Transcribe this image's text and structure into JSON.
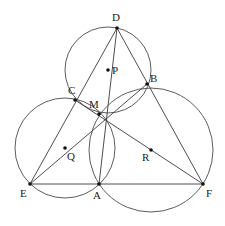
{
  "diagram": {
    "type": "geometry",
    "colors": {
      "stroke": "#4a4a4a",
      "point": "#111111",
      "label": "#222222",
      "background": "#ffffff"
    },
    "points": {
      "D": {
        "x": 117,
        "y": 28,
        "label": "D",
        "lx": 112,
        "ly": 21
      },
      "B": {
        "x": 147,
        "y": 84,
        "label": "B",
        "lx": 150,
        "ly": 82
      },
      "C": {
        "x": 75,
        "y": 100,
        "label": "C",
        "lx": 68,
        "ly": 94
      },
      "M": {
        "x": 99,
        "y": 114,
        "label": "M",
        "lx": 89,
        "ly": 108
      },
      "P": {
        "x": 108,
        "y": 70,
        "label": "P",
        "lx": 112,
        "ly": 74
      },
      "Q": {
        "x": 65,
        "y": 148,
        "label": "Q",
        "lx": 67,
        "ly": 160
      },
      "R": {
        "x": 151,
        "y": 150,
        "label": "R",
        "lx": 142,
        "ly": 161
      },
      "E": {
        "x": 30,
        "y": 184,
        "label": "E",
        "lx": 20,
        "ly": 197
      },
      "A": {
        "x": 99,
        "y": 184,
        "label": "A",
        "lx": 93,
        "ly": 199
      },
      "F": {
        "x": 203,
        "y": 184,
        "label": "F",
        "lx": 206,
        "ly": 197
      }
    },
    "circles": [
      {
        "name": "circle-P",
        "center": "P",
        "cx": 108,
        "cy": 70,
        "r": 43
      },
      {
        "name": "circle-Q",
        "center": "Q",
        "cx": 65,
        "cy": 148,
        "r": 50
      },
      {
        "name": "circle-R",
        "center": "R",
        "cx": 151,
        "cy": 150,
        "r": 62
      }
    ],
    "segments": [
      [
        "D",
        "E"
      ],
      [
        "D",
        "F"
      ],
      [
        "E",
        "F"
      ],
      [
        "D",
        "A"
      ],
      [
        "E",
        "B"
      ],
      [
        "C",
        "F"
      ]
    ],
    "labels": [
      "D",
      "B",
      "C",
      "M",
      "P",
      "Q",
      "R",
      "E",
      "A",
      "F"
    ]
  }
}
